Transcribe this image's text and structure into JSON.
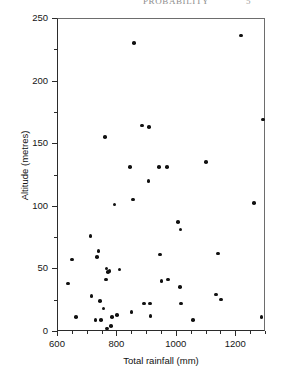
{
  "page": {
    "running_head": "PROBABILITY",
    "folio": "5"
  },
  "chart_data": {
    "type": "scatter",
    "title": "",
    "xlabel": "Total rainfall (mm)",
    "ylabel": "Altitude (metres)",
    "xlim": [
      600,
      1300
    ],
    "ylim": [
      0,
      250
    ],
    "x_major_ticks": [
      600,
      800,
      1000,
      1200
    ],
    "x_minor_step": 50,
    "y_major_ticks": [
      0,
      50,
      100,
      150,
      200,
      250
    ],
    "y_minor_step": 25,
    "grid": false,
    "legend": null,
    "marker": "filled-circle",
    "marker_color": "#111111",
    "n_points": 52,
    "points": [
      [
        637,
        38
      ],
      [
        651,
        57
      ],
      [
        663,
        11
      ],
      [
        713,
        76
      ],
      [
        716,
        28
      ],
      [
        729,
        9
      ],
      [
        735,
        59
      ],
      [
        740,
        64
      ],
      [
        745,
        24
      ],
      [
        748,
        9
      ],
      [
        757,
        18
      ],
      [
        762,
        155
      ],
      [
        764,
        41
      ],
      [
        766,
        50
      ],
      [
        768,
        2
      ],
      [
        772,
        47
      ],
      [
        777,
        48
      ],
      [
        781,
        4
      ],
      [
        786,
        11
      ],
      [
        794,
        101
      ],
      [
        801,
        13
      ],
      [
        810,
        49
      ],
      [
        846,
        131
      ],
      [
        851,
        15
      ],
      [
        856,
        105
      ],
      [
        860,
        230
      ],
      [
        886,
        164
      ],
      [
        893,
        22
      ],
      [
        908,
        120
      ],
      [
        910,
        163
      ],
      [
        912,
        22
      ],
      [
        914,
        12
      ],
      [
        944,
        131
      ],
      [
        946,
        61
      ],
      [
        951,
        40
      ],
      [
        971,
        131
      ],
      [
        973,
        41
      ],
      [
        1007,
        87
      ],
      [
        1013,
        35
      ],
      [
        1016,
        81
      ],
      [
        1018,
        22
      ],
      [
        1058,
        9
      ],
      [
        1101,
        135
      ],
      [
        1136,
        29
      ],
      [
        1141,
        62
      ],
      [
        1152,
        25
      ],
      [
        1219,
        236
      ],
      [
        1262,
        102
      ],
      [
        1288,
        11
      ],
      [
        1294,
        169
      ]
    ]
  }
}
